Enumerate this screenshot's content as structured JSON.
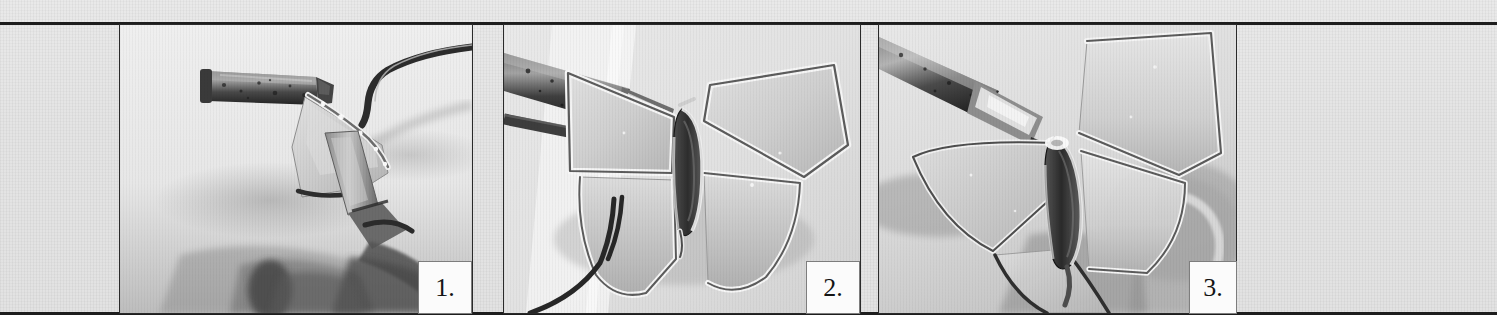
{
  "page": {
    "background_color": "#e4e4e4",
    "paper_color": "#e6e6e6",
    "rule_color": "#1d1d1d",
    "below_fold_color": "#ffffff"
  },
  "figure": {
    "kind": "photo-sequence",
    "panel_count": 3,
    "panels": [
      {
        "number_label": "1.",
        "alt": "Close-up of a soldering iron tip touching the solder bead along the edge of a triangular frosted glass piece held in pliers",
        "subject": "soldering-iron-and-glass-piece",
        "tone": "grayscale",
        "background_tone": "#e8e8e8"
      },
      {
        "number_label": "2.",
        "alt": "Soldering iron resting on the soldered seam of a fully assembled stained glass butterfly lying flat, wings outstretched",
        "subject": "stained-glass-butterfly-flat",
        "tone": "grayscale",
        "background_tone": "#e4e4e4"
      },
      {
        "number_label": "3.",
        "alt": "Soldering iron tip at the body seam of the stained glass butterfly with the wings bent upward at an angle",
        "subject": "stained-glass-butterfly-bent-wings",
        "tone": "grayscale",
        "background_tone": "#e2e2e2"
      }
    ]
  },
  "colors": {
    "solder_highlight": "#f4f4f4",
    "solder_shadow": "#4a4a4a",
    "glass_light": "#dcdcdc",
    "glass_mid": "#c4c4c4",
    "iron_dark": "#2e2e2e",
    "body_dark": "#3a3a3a"
  }
}
